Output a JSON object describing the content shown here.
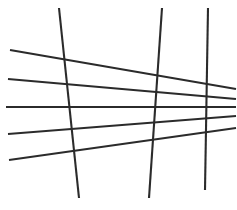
{
  "figure": {
    "width": 237,
    "height": 210,
    "background_color": "#ffffff",
    "stroke_color": "#2b2b2b",
    "stroke_width": 2.1
  },
  "chart_data": {
    "type": "line",
    "subtitle": "",
    "xlabel": "",
    "ylabel": "",
    "xlim": [
      0,
      237
    ],
    "ylim": [
      0,
      210
    ],
    "grid": false,
    "legend": "none",
    "annotations": [],
    "series": [
      {
        "name": "horizontal-1",
        "orientation": "horizontal",
        "x": [
          10,
          236
        ],
        "y": [
          50,
          89
        ],
        "values": [
          50,
          89
        ]
      },
      {
        "name": "horizontal-2",
        "orientation": "horizontal",
        "x": [
          8,
          236
        ],
        "y": [
          79,
          99
        ],
        "values": [
          79,
          99
        ]
      },
      {
        "name": "horizontal-3",
        "orientation": "horizontal",
        "x": [
          6,
          236
        ],
        "y": [
          107,
          107
        ],
        "values": [
          107,
          107
        ]
      },
      {
        "name": "horizontal-4",
        "orientation": "horizontal",
        "x": [
          8,
          236
        ],
        "y": [
          134,
          116
        ],
        "values": [
          134,
          116
        ]
      },
      {
        "name": "horizontal-5",
        "orientation": "horizontal",
        "x": [
          9,
          236
        ],
        "y": [
          160,
          128
        ],
        "values": [
          160,
          128
        ]
      },
      {
        "name": "vertical-1",
        "orientation": "vertical",
        "x": [
          59,
          79
        ],
        "y": [
          8,
          198
        ],
        "values": [
          59,
          79
        ]
      },
      {
        "name": "vertical-2",
        "orientation": "vertical",
        "x": [
          162,
          149
        ],
        "y": [
          8,
          198
        ],
        "values": [
          162,
          149
        ]
      },
      {
        "name": "vertical-3",
        "orientation": "vertical",
        "x": [
          208,
          205
        ],
        "y": [
          8,
          190
        ],
        "values": [
          208,
          205
        ]
      }
    ]
  }
}
